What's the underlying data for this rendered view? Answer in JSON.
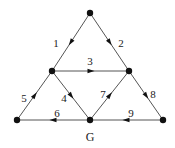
{
  "diagram": {
    "type": "directed-graph",
    "graph_label": "G",
    "colors": {
      "line": "#555555",
      "node": "#111111",
      "text": "#222222",
      "background": "#ffffff"
    },
    "nodes": [
      {
        "id": "top",
        "x": 90,
        "y": 13
      },
      {
        "id": "mid-left",
        "x": 52,
        "y": 71
      },
      {
        "id": "mid-right",
        "x": 129,
        "y": 71
      },
      {
        "id": "bottom-left",
        "x": 17,
        "y": 120
      },
      {
        "id": "bottom-middle",
        "x": 90,
        "y": 120
      },
      {
        "id": "bottom-right",
        "x": 163,
        "y": 120
      }
    ],
    "edges": [
      {
        "label": "1",
        "from": "top",
        "to": "mid-left",
        "label_x": 56,
        "label_y": 47
      },
      {
        "label": "2",
        "from": "top",
        "to": "mid-right",
        "label_x": 121,
        "label_y": 47
      },
      {
        "label": "3",
        "from": "mid-left",
        "to": "mid-right",
        "label_x": 90,
        "label_y": 65
      },
      {
        "label": "4",
        "from": "mid-left",
        "to": "bottom-middle",
        "label_x": 64,
        "label_y": 102
      },
      {
        "label": "5",
        "from": "bottom-left",
        "to": "mid-left",
        "label_x": 24,
        "label_y": 102
      },
      {
        "label": "6",
        "from": "bottom-middle",
        "to": "bottom-left",
        "label_x": 57,
        "label_y": 117
      },
      {
        "label": "7",
        "from": "bottom-middle",
        "to": "mid-right",
        "label_x": 103,
        "label_y": 98
      },
      {
        "label": "8",
        "from": "mid-right",
        "to": "bottom-right",
        "label_x": 153,
        "label_y": 98
      },
      {
        "label": "9",
        "from": "bottom-right",
        "to": "bottom-middle",
        "label_x": 131,
        "label_y": 117
      }
    ]
  }
}
